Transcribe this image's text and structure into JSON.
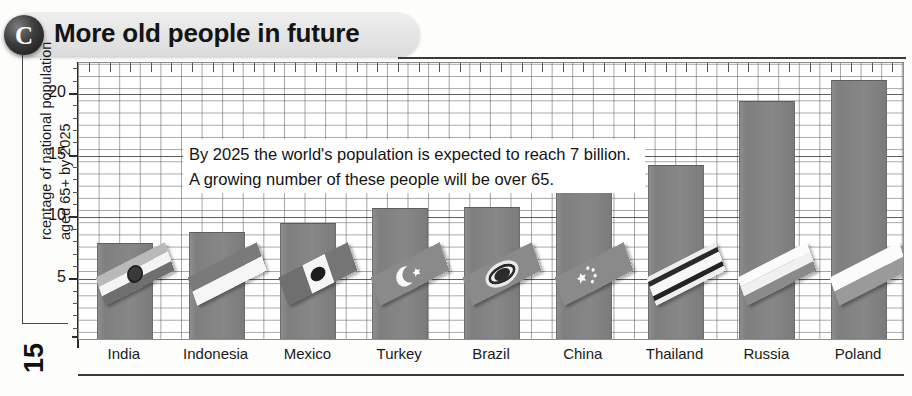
{
  "page": {
    "folio": "15"
  },
  "banner": {
    "badge_letter": "C",
    "title": "More old people in future"
  },
  "callout": {
    "line1": "By 2025 the world's population is expected to reach 7 billion.",
    "line2": "A growing number of these people will be over 65."
  },
  "axis": {
    "y_label_line1": "rcentage of national population",
    "y_label_line2": "aged 65+ by 2025",
    "y_ticks": [
      "5",
      "10",
      "15",
      "20"
    ]
  },
  "colors": {
    "bar": "#838383",
    "grid": "#5a5a5a",
    "axis": "#2b2b2b",
    "banner": "#e6e6e6",
    "badge": "#1a1a1a",
    "text": "#141414"
  },
  "chart_data": {
    "type": "bar",
    "title": "More old people in future",
    "xlabel": "",
    "ylabel": "Percentage of national population aged 65+ by 2025",
    "ylim": [
      0,
      22.5
    ],
    "ytick_values": [
      5,
      10,
      15,
      20
    ],
    "grid": true,
    "legend": "none",
    "categories": [
      "India",
      "Indonesia",
      "Mexico",
      "Turkey",
      "Brazil",
      "China",
      "Thailand",
      "Russia",
      "Poland"
    ],
    "values": [
      7.8,
      8.7,
      9.4,
      10.6,
      10.7,
      13.1,
      14.1,
      19.3,
      21.0
    ],
    "annotation": "By 2025 the world's population is expected to reach 7 billion. A growing number of these people will be over 65.",
    "bar_flags": [
      "India",
      "Indonesia",
      "Mexico",
      "Turkey",
      "Brazil",
      "China",
      "Thailand",
      "Russia",
      "Poland"
    ]
  }
}
